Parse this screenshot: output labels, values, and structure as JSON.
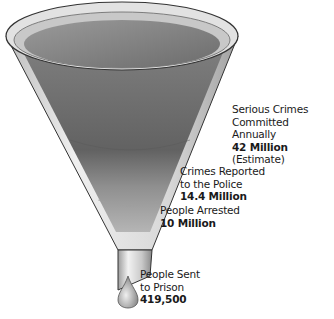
{
  "figure": {
    "type": "funnel-diagram",
    "stages": [
      {
        "lines": [
          "Serious Crimes",
          "Committed Annually"
        ],
        "value": "42 Million",
        "note": "(Estimate)"
      },
      {
        "lines": [
          "Crimes Reported",
          "to the Police"
        ],
        "value": "14.4 Million",
        "note": ""
      },
      {
        "lines": [
          "People Arrested"
        ],
        "value": "10 Million",
        "note": ""
      },
      {
        "lines": [
          "People Sent",
          "to Prison"
        ],
        "value": "419,500",
        "note": ""
      }
    ],
    "caption_visible": "partially cut off, illegible"
  },
  "colors": {
    "glass": "#d9d9d9",
    "liquid_top": "#8c8c8c",
    "liquid_mid": "#6e6e6e",
    "liquid_low": "#a8a8a8",
    "outline": "#333333"
  }
}
